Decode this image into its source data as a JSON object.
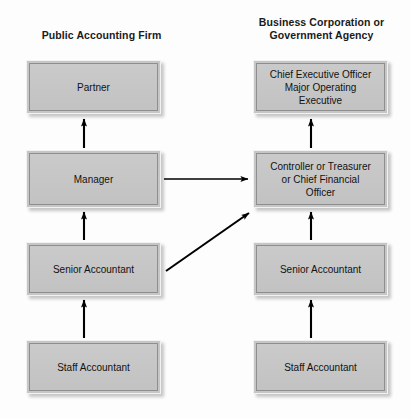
{
  "diagram": {
    "title_left": "Public Accounting Firm",
    "title_right": "Business Corporation or\nGovernment Agency",
    "columns": [
      {
        "name": "public-accounting-firm",
        "heading": "Public Accounting Firm",
        "nodes": [
          {
            "id": "partner",
            "label": "Partner"
          },
          {
            "id": "manager",
            "label": "Manager"
          },
          {
            "id": "senior-accountant-left",
            "label": "Senior Accountant"
          },
          {
            "id": "staff-accountant-left",
            "label": "Staff Accountant"
          }
        ]
      },
      {
        "name": "business-corporation-or-government-agency",
        "heading": "Business Corporation or Government Agency",
        "nodes": [
          {
            "id": "chief-executive-officer",
            "label": "Chief Executive Officer\nMajor Operating\nExecutive"
          },
          {
            "id": "controller",
            "label": "Controller or Treasurer\nor Chief Financial\nOfficer"
          },
          {
            "id": "senior-accountant-right",
            "label": "Senior Accountant"
          },
          {
            "id": "staff-accountant-right",
            "label": "Staff Accountant"
          }
        ]
      }
    ],
    "connectors": [
      {
        "id": "staff-to-senior-left",
        "from": "staff-accountant-left",
        "to": "senior-accountant-left",
        "direction": "up"
      },
      {
        "id": "senior-to-manager-left",
        "from": "senior-accountant-left",
        "to": "manager",
        "direction": "up"
      },
      {
        "id": "manager-to-partner",
        "from": "manager",
        "to": "partner",
        "direction": "up"
      },
      {
        "id": "staff-to-senior-right",
        "from": "staff-accountant-right",
        "to": "senior-accountant-right",
        "direction": "up"
      },
      {
        "id": "senior-to-controller-right",
        "from": "senior-accountant-right",
        "to": "controller",
        "direction": "up"
      },
      {
        "id": "controller-to-ceo",
        "from": "controller",
        "to": "chief-executive-officer",
        "direction": "up"
      },
      {
        "id": "manager-to-controller",
        "from": "manager",
        "to": "controller",
        "direction": "right"
      },
      {
        "id": "senior-left-to-controller",
        "from": "senior-accountant-left",
        "to": "controller",
        "direction": "diagonal-up-right"
      }
    ],
    "colors": {
      "box_fill": "#c5c5c5",
      "box_border": "#8e8e8e",
      "box_highlight": "#f2f2f2",
      "arrow": "#000000",
      "text": "#121212",
      "background": "#fdfdfd"
    }
  }
}
